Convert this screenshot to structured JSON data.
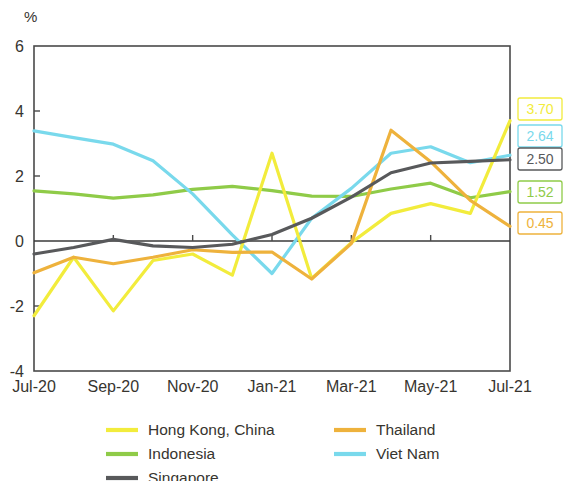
{
  "chart_data": {
    "type": "line",
    "title": "",
    "subtitle": "",
    "xlabel": "",
    "ylabel": "%",
    "unit_label": "%",
    "ylim": [
      -4,
      6
    ],
    "yticks": [
      6,
      4,
      2,
      0,
      -2,
      -4
    ],
    "ytick_labels": [
      "6",
      "4",
      "2",
      "0",
      "-2",
      "-4"
    ],
    "grid": false,
    "zero_line": true,
    "legend_position": "bottom",
    "x": [
      "Jul-20",
      "Aug-20",
      "Sep-20",
      "Oct-20",
      "Nov-20",
      "Dec-20",
      "Jan-21",
      "Feb-21",
      "Mar-21",
      "Apr-21",
      "May-21",
      "Jun-21",
      "Jul-21"
    ],
    "xtick_labels": [
      "Jul-20",
      "Sep-20",
      "Nov-20",
      "Jan-21",
      "Mar-21",
      "May-21",
      "Jul-21"
    ],
    "xtick_indices": [
      0,
      2,
      4,
      6,
      8,
      10,
      12
    ],
    "series": [
      {
        "name": "Hong Kong, China",
        "color": "#f2ec3c",
        "values": [
          -2.3,
          -0.5,
          -2.15,
          -0.6,
          -0.4,
          -1.05,
          2.7,
          -1.15,
          -0.05,
          0.85,
          1.15,
          0.85,
          3.7
        ],
        "end_label": "3.70"
      },
      {
        "name": "Indonesia",
        "color": "#8fcb48",
        "values": [
          1.54,
          1.45,
          1.32,
          1.42,
          1.59,
          1.68,
          1.55,
          1.38,
          1.37,
          1.6,
          1.78,
          1.33,
          1.52
        ],
        "end_label": "1.52"
      },
      {
        "name": "Singapore",
        "color": "#58595b",
        "values": [
          -0.4,
          -0.2,
          0.05,
          -0.15,
          -0.2,
          -0.1,
          0.2,
          0.7,
          1.35,
          2.1,
          2.4,
          2.45,
          2.5
        ],
        "end_label": "2.50"
      },
      {
        "name": "Thailand",
        "color": "#eeb23c",
        "values": [
          -0.98,
          -0.5,
          -0.7,
          -0.5,
          -0.27,
          -0.35,
          -0.34,
          -1.17,
          -0.08,
          3.41,
          2.44,
          1.25,
          0.45
        ],
        "end_label": "0.45"
      },
      {
        "name": "Viet Nam",
        "color": "#79d9ec",
        "values": [
          3.39,
          3.18,
          2.98,
          2.47,
          1.45,
          0.19,
          -1.0,
          0.7,
          1.62,
          2.7,
          2.9,
          2.41,
          2.64
        ],
        "end_label": "2.64"
      }
    ],
    "end_labels": [
      {
        "value": "3.70",
        "color": "#f2ec3c",
        "series": "Hong Kong, China"
      },
      {
        "value": "2.64",
        "color": "#79d9ec",
        "series": "Viet Nam"
      },
      {
        "value": "2.50",
        "color": "#58595b",
        "series": "Singapore"
      },
      {
        "value": "1.52",
        "color": "#8fcb48",
        "series": "Indonesia"
      },
      {
        "value": "0.45",
        "color": "#eeb23c",
        "series": "Thailand"
      }
    ],
    "legend": [
      {
        "label": "Hong Kong, China",
        "color": "#f2ec3c"
      },
      {
        "label": "Indonesia",
        "color": "#8fcb48"
      },
      {
        "label": "Singapore",
        "color": "#58595b"
      },
      {
        "label": "Thailand",
        "color": "#eeb23c"
      },
      {
        "label": "Viet Nam",
        "color": "#79d9ec"
      }
    ]
  }
}
